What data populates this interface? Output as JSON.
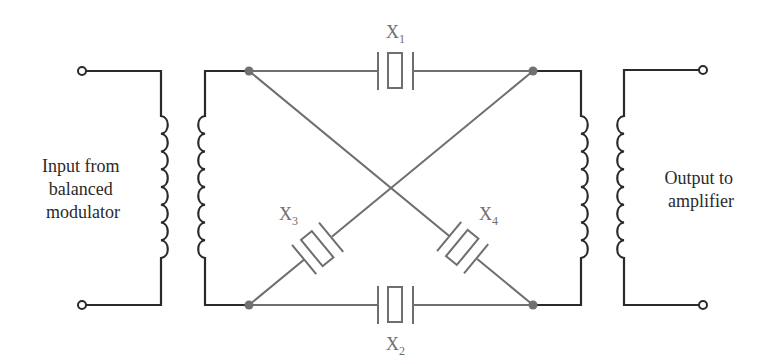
{
  "input_label": {
    "line1": "Input from",
    "line2": "balanced",
    "line3": "modulator"
  },
  "output_label": {
    "line1": "Output to",
    "line2": "amplifier"
  },
  "crystals": [
    {
      "id": "X1",
      "letter": "X",
      "subscript": "1",
      "position": "top"
    },
    {
      "id": "X2",
      "letter": "X",
      "subscript": "2",
      "position": "bottom"
    },
    {
      "id": "X3",
      "letter": "X",
      "subscript": "3",
      "position": "diagonal-lower-left"
    },
    {
      "id": "X4",
      "letter": "X",
      "subscript": "4",
      "position": "diagonal-lower-right"
    }
  ],
  "colors": {
    "transformer": "#2a2a2a",
    "lattice": "#6e6e6e"
  }
}
